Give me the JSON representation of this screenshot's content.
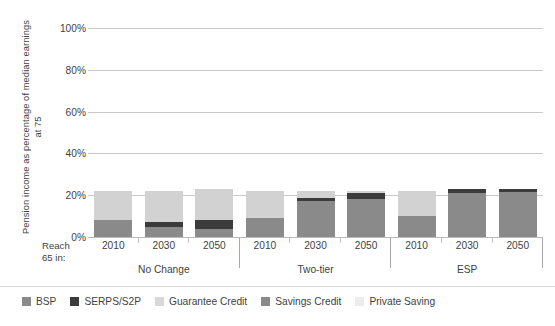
{
  "chart_data": {
    "type": "bar",
    "stacked": true,
    "title": "",
    "xlabel": "Reach 65 in:",
    "ylabel": "Pension income as percentage of median earnings at 75",
    "ylim": [
      0,
      100
    ],
    "yticks": [
      "0%",
      "20%",
      "40%",
      "60%",
      "80%",
      "100%"
    ],
    "ytick_values": [
      0,
      20,
      40,
      60,
      80,
      100
    ],
    "grid": true,
    "legend_position": "bottom",
    "groups": [
      "No Change",
      "Two-tier",
      "ESP"
    ],
    "categories": [
      "2010",
      "2030",
      "2050",
      "2010",
      "2030",
      "2050",
      "2010",
      "2030",
      "2050"
    ],
    "series": [
      {
        "name": "BSP",
        "color": "#8a8a8a",
        "values": [
          8,
          5,
          4,
          9,
          17,
          18,
          10,
          21,
          21.5
        ]
      },
      {
        "name": "SERPS/S2P",
        "color": "#3b3b3b",
        "values": [
          0,
          2,
          4,
          0,
          1.5,
          3,
          0,
          2,
          1.5
        ]
      },
      {
        "name": "Guarantee Credit",
        "color": "#d2d2d2",
        "values": [
          14,
          15,
          15,
          13,
          3.5,
          1,
          12,
          0,
          0
        ]
      },
      {
        "name": "Savings Credit",
        "color": "#8a8a8a",
        "values": [
          0,
          0,
          0,
          0,
          0,
          0,
          0,
          0,
          0
        ]
      },
      {
        "name": "Private Saving",
        "color": "#e8e8e8",
        "values": [
          0,
          0,
          0,
          0,
          0,
          0,
          0,
          0,
          0
        ]
      }
    ],
    "totals": [
      22,
      22,
      23,
      22,
      22,
      22,
      22,
      23,
      23
    ]
  },
  "axis": {
    "y_title": "Pension income as percentage of median earnings at 75",
    "x_corner_label": "Reach\n65 in:",
    "x_corner_line1": "Reach",
    "x_corner_line2": "65 in:",
    "ticks": [
      {
        "label": "100%",
        "value": 100
      },
      {
        "label": "80%",
        "value": 80
      },
      {
        "label": "60%",
        "value": 60
      },
      {
        "label": "40%",
        "value": 40
      },
      {
        "label": "20%",
        "value": 20
      },
      {
        "label": "0%",
        "value": 0
      }
    ]
  },
  "groups": [
    {
      "name": "No Change",
      "bars": [
        {
          "year": "2010",
          "segments": [
            {
              "series": "BSP",
              "value": 8
            },
            {
              "series": "Guarantee Credit",
              "value": 14
            }
          ]
        },
        {
          "year": "2030",
          "segments": [
            {
              "series": "BSP",
              "value": 5
            },
            {
              "series": "SERPS/S2P",
              "value": 2
            },
            {
              "series": "Guarantee Credit",
              "value": 15
            }
          ]
        },
        {
          "year": "2050",
          "segments": [
            {
              "series": "BSP",
              "value": 4
            },
            {
              "series": "SERPS/S2P",
              "value": 4
            },
            {
              "series": "Guarantee Credit",
              "value": 15
            }
          ]
        }
      ]
    },
    {
      "name": "Two-tier",
      "bars": [
        {
          "year": "2010",
          "segments": [
            {
              "series": "BSP",
              "value": 9
            },
            {
              "series": "Guarantee Credit",
              "value": 13
            }
          ]
        },
        {
          "year": "2030",
          "segments": [
            {
              "series": "BSP",
              "value": 17
            },
            {
              "series": "SERPS/S2P",
              "value": 1.5
            },
            {
              "series": "Guarantee Credit",
              "value": 3.5
            }
          ]
        },
        {
          "year": "2050",
          "segments": [
            {
              "series": "BSP",
              "value": 18
            },
            {
              "series": "SERPS/S2P",
              "value": 3
            },
            {
              "series": "Guarantee Credit",
              "value": 1
            }
          ]
        }
      ]
    },
    {
      "name": "ESP",
      "bars": [
        {
          "year": "2010",
          "segments": [
            {
              "series": "BSP",
              "value": 10
            },
            {
              "series": "Guarantee Credit",
              "value": 12
            }
          ]
        },
        {
          "year": "2030",
          "segments": [
            {
              "series": "BSP",
              "value": 21
            },
            {
              "series": "SERPS/S2P",
              "value": 2
            }
          ]
        },
        {
          "year": "2050",
          "segments": [
            {
              "series": "BSP",
              "value": 21.5
            },
            {
              "series": "SERPS/S2P",
              "value": 1.5
            }
          ]
        }
      ]
    }
  ],
  "legend": {
    "items": [
      {
        "label": "BSP",
        "color": "#8a8a8a"
      },
      {
        "label": "SERPS/S2P",
        "color": "#3b3b3b"
      },
      {
        "label": "Guarantee Credit",
        "color": "#d8d8d8"
      },
      {
        "label": "Savings Credit",
        "color": "#8a8a8a"
      },
      {
        "label": "Private Saving",
        "color": "#ececec"
      }
    ]
  },
  "colors": {
    "gridline": "#c9c9c9",
    "axis": "#b9b9b9",
    "text": "#3f3f3f",
    "background": "#ffffff"
  }
}
